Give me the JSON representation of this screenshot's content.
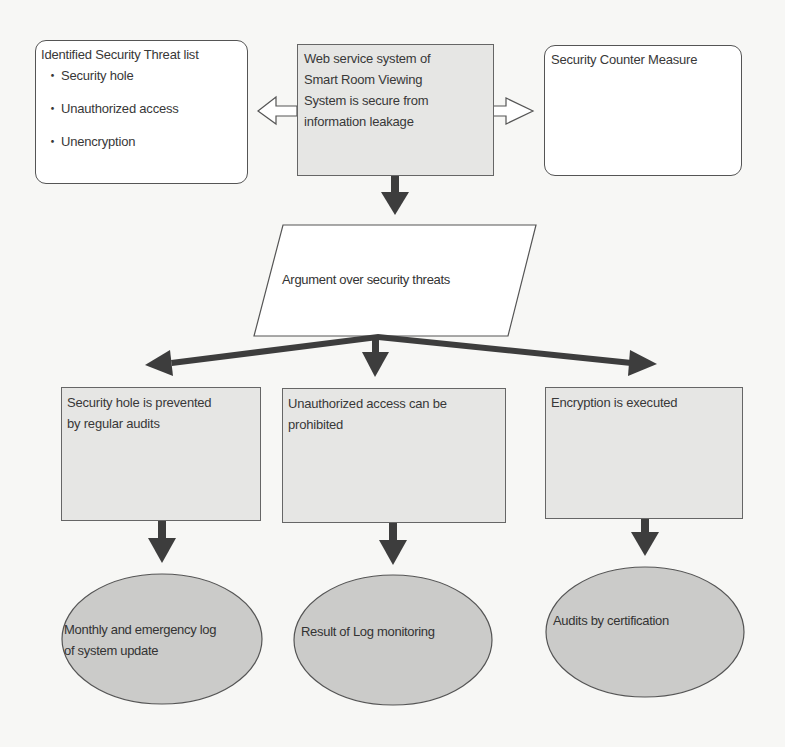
{
  "diagram": {
    "colors": {
      "arrow": "#3d3d3d",
      "shaded_fill": "#e6e6e4",
      "ellipse_fill": "#cbcbc9",
      "outline": "#555555",
      "text": "#383838"
    },
    "threat_list": {
      "title": "Identified Security Threat list",
      "bullet": "・",
      "items": [
        "Security hole",
        "Unauthorized access",
        "Unencryption"
      ]
    },
    "goal": {
      "text": "Web service system of Smart Room Viewing System is secure from information leakage",
      "lines": [
        "Web service system of",
        "Smart Room Viewing",
        "System is secure from",
        "information leakage"
      ]
    },
    "counter_measure": {
      "title": "Security Counter Measure"
    },
    "strategy": {
      "text": "Argument over security threats"
    },
    "sub_goals": [
      {
        "lines": [
          "Security hole is prevented",
          "by regular audits"
        ]
      },
      {
        "lines": [
          "Unauthorized access can be",
          "prohibited"
        ]
      },
      {
        "lines": [
          "Encryption is executed"
        ]
      }
    ],
    "evidence": [
      {
        "lines": [
          "Monthly and emergency log",
          "of system update"
        ]
      },
      {
        "lines": [
          "Result of Log monitoring"
        ]
      },
      {
        "lines": [
          "Audits by certification"
        ]
      }
    ],
    "connections": [
      {
        "from": "goal",
        "to": "threat_list",
        "style": "hollow-arrow"
      },
      {
        "from": "goal",
        "to": "counter_measure",
        "style": "hollow-arrow"
      },
      {
        "from": "goal",
        "to": "strategy",
        "style": "solid-arrow"
      },
      {
        "from": "strategy",
        "to": "sub_goal_1",
        "style": "solid-arrow"
      },
      {
        "from": "strategy",
        "to": "sub_goal_2",
        "style": "solid-arrow"
      },
      {
        "from": "strategy",
        "to": "sub_goal_3",
        "style": "solid-arrow"
      },
      {
        "from": "sub_goal_1",
        "to": "evidence_1",
        "style": "solid-arrow"
      },
      {
        "from": "sub_goal_2",
        "to": "evidence_2",
        "style": "solid-arrow"
      },
      {
        "from": "sub_goal_3",
        "to": "evidence_3",
        "style": "solid-arrow"
      }
    ]
  }
}
